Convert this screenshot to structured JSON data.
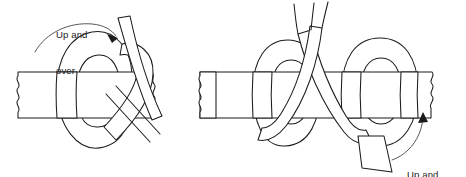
{
  "figure": {
    "background_color": "#ffffff",
    "line_color": "#1b1b1b",
    "width": 466,
    "height": 177,
    "panels": [
      {
        "id": "left-panel",
        "name": "step-1-up-and-over",
        "label": {
          "id": "caption-up-over",
          "line1": "Up and",
          "line2": "over"
        },
        "arrow": {
          "name": "curved-arrow-up-over",
          "direction": "clockwise-right",
          "points_to": "strap-end"
        }
      },
      {
        "id": "right-panel",
        "name": "step-2-up-and-through",
        "label": {
          "id": "caption-up-through",
          "line1": "Up and",
          "line2": "through"
        },
        "arrow": {
          "name": "curved-arrow-up-through",
          "direction": "counterclockwise-up",
          "points_to": "knot-loop"
        }
      }
    ],
    "elements": {
      "belt_left": "horizontal-belt-left",
      "belt_right": "horizontal-belt-right",
      "loop_left": "vertical-loop-left",
      "loop_right": "vertical-loop-right",
      "strap_tail": "strap-tail-end"
    }
  }
}
